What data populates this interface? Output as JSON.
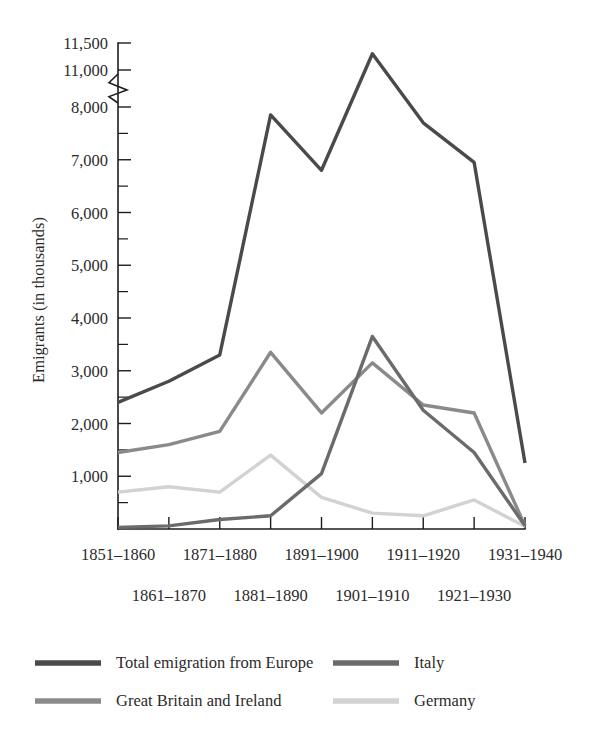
{
  "chart_data": {
    "type": "line",
    "title": "",
    "xlabel": "",
    "ylabel": "Emigrants (in thousands)",
    "grid": false,
    "legend_position": "bottom",
    "axis_break": {
      "present": true,
      "between": [
        8000,
        11000
      ],
      "note": "broken y-axis between 8,000 and 11,000"
    },
    "ylim": [
      0,
      11500
    ],
    "y_ticks_major": [
      1000,
      2000,
      3000,
      4000,
      5000,
      6000,
      7000,
      8000,
      11000,
      11500
    ],
    "y_tick_labels": [
      "1,000",
      "2,000",
      "3,000",
      "4,000",
      "5,000",
      "6,000",
      "7,000",
      "8,000",
      "11,000",
      "11,500"
    ],
    "y_ticks_minor": [
      500,
      1500,
      2500,
      3500,
      4500,
      5500,
      6500,
      7500
    ],
    "categories": [
      "1851–1860",
      "1861–1870",
      "1871–1880",
      "1881–1890",
      "1891–1900",
      "1901–1910",
      "1911–1920",
      "1921–1930",
      "1931–1940"
    ],
    "x_labels_row_top": [
      "1851–1860",
      "1871–1880",
      "1891–1900",
      "1911–1920",
      "1931–1940"
    ],
    "x_labels_row_bottom": [
      "1861–1870",
      "1881–1890",
      "1901–1910",
      "1921–1930"
    ],
    "series": [
      {
        "name": "Total emigration from Europe",
        "color": "#4a4a4a",
        "width": 3.4,
        "values": [
          2400,
          2800,
          3300,
          7850,
          6800,
          11300,
          7700,
          6950,
          1250
        ]
      },
      {
        "name": "Great Britain and Ireland",
        "color": "#8a8a8a",
        "width": 3.4,
        "values": [
          1450,
          1600,
          1850,
          3350,
          2200,
          3150,
          2350,
          2200,
          60
        ]
      },
      {
        "name": "Italy",
        "color": "#6b6b6b",
        "width": 3.4,
        "values": [
          30,
          60,
          180,
          250,
          1050,
          3650,
          2250,
          1450,
          60
        ]
      },
      {
        "name": "Germany",
        "color": "#d2d2d2",
        "width": 3.4,
        "values": [
          700,
          800,
          700,
          1400,
          600,
          300,
          250,
          550,
          50
        ]
      }
    ]
  },
  "legend": {
    "entries": [
      {
        "label": "Total emigration from Europe",
        "color": "#4a4a4a"
      },
      {
        "label": "Italy",
        "color": "#6b6b6b"
      },
      {
        "label": "Great Britain and Ireland",
        "color": "#8a8a8a"
      },
      {
        "label": "Germany",
        "color": "#d2d2d2"
      }
    ]
  }
}
